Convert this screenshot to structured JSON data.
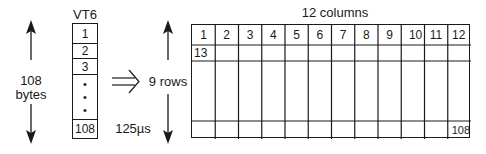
{
  "left": {
    "arrow_label_line1": "108",
    "arrow_label_line2": "bytes",
    "column_title": "VT6",
    "cells": [
      "1",
      "2",
      "3",
      "•",
      "•",
      "•",
      "108"
    ],
    "duration": "125µs"
  },
  "transform_arrow": "⇒",
  "right": {
    "title": "12 columns",
    "rows_label": "9 rows",
    "header": [
      "1",
      "2",
      "3",
      "4",
      "5",
      "6",
      "7",
      "8",
      "9",
      "10",
      "11",
      "12"
    ],
    "second_row_first_cell": "13",
    "last_row_last_cell": "108"
  }
}
